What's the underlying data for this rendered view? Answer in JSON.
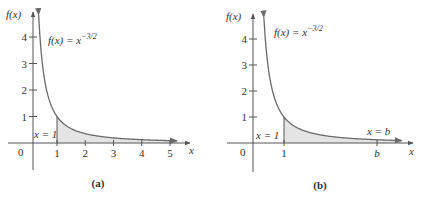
{
  "colors": {
    "axis": "#555555",
    "curve": "#6a6a6a",
    "fill": "#e4e4e4",
    "text": "#333333"
  },
  "chart_data": [
    {
      "type": "area",
      "panel_label": "(a)",
      "function_label": "f(x) = x",
      "function_exponent": "−3/2",
      "function": "x^(-3/2)",
      "xlabel": "x",
      "ylabel": "f(x)",
      "origin_label": "0",
      "x_ticks": [
        "1",
        "2",
        "3",
        "4",
        "5"
      ],
      "y_ticks": [
        "1",
        "2",
        "3",
        "4"
      ],
      "shaded_from_label": "x = 1",
      "shaded_region": {
        "from": 1,
        "to": 5.25,
        "open_right": true
      },
      "xlim": [
        0,
        5.5
      ],
      "ylim": [
        0,
        4.8
      ],
      "grid": false,
      "points": [
        {
          "x": 0.35,
          "y": 4.8
        },
        {
          "x": 0.5,
          "y": 2.83
        },
        {
          "x": 0.75,
          "y": 1.54
        },
        {
          "x": 1,
          "y": 1
        },
        {
          "x": 2,
          "y": 0.35
        },
        {
          "x": 3,
          "y": 0.19
        },
        {
          "x": 4,
          "y": 0.125
        },
        {
          "x": 5,
          "y": 0.089
        }
      ]
    },
    {
      "type": "area",
      "panel_label": "(b)",
      "function_label": "f(x) = x",
      "function_exponent": "−3/2",
      "function": "x^(-3/2)",
      "xlabel": "x",
      "ylabel": "f(x)",
      "origin_label": "0",
      "x_ticks": [
        "1",
        "b"
      ],
      "y_ticks": [
        "1",
        "2",
        "3",
        "4"
      ],
      "shaded_from_label": "x = 1",
      "shaded_to_label": "x = b",
      "shaded_region": {
        "from": 1,
        "to": "b",
        "open_right": true
      },
      "grid": false
    }
  ]
}
